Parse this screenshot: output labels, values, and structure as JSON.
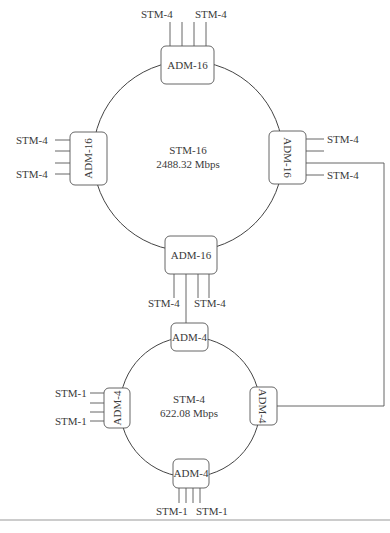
{
  "rings": {
    "outer": {
      "name": "STM-16",
      "rate": "2488.32 Mbps"
    },
    "inner": {
      "name": "STM-4",
      "rate": "622.08 Mbps"
    }
  },
  "nodes": {
    "outer_top": {
      "label": "ADM-16",
      "tributary_left": "STM-4",
      "tributary_right": "STM-4"
    },
    "outer_left": {
      "label": "ADM-16",
      "tributary_top": "STM-4",
      "tributary_bottom": "STM-4"
    },
    "outer_right": {
      "label": "ADM-16",
      "tributary_top": "STM-4",
      "tributary_bottom": "STM-4"
    },
    "outer_bottom": {
      "label": "ADM-16",
      "tributary_left": "STM-4",
      "tributary_right": "STM-4"
    },
    "inner_top": {
      "label": "ADM-4"
    },
    "inner_left": {
      "label": "ADM-4",
      "tributary_top": "STM-1",
      "tributary_bottom": "STM-1"
    },
    "inner_right": {
      "label": "ADM-4"
    },
    "inner_bottom": {
      "label": "ADM-4",
      "tributary_left": "STM-1",
      "tributary_right": "STM-1"
    }
  },
  "caption": ""
}
